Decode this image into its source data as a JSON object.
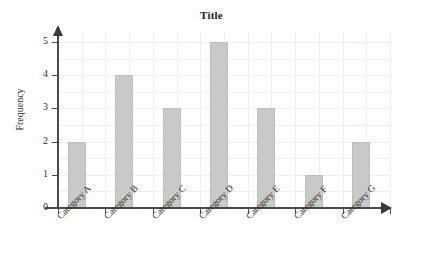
{
  "chart_data": {
    "type": "bar",
    "title": "Title",
    "xlabel": "",
    "ylabel": "Frequency",
    "categories": [
      "Category A",
      "Category B",
      "Category C",
      "Category D",
      "Category E",
      "Category F",
      "Category G"
    ],
    "values": [
      2,
      4,
      3,
      5,
      3,
      1,
      2
    ],
    "ylim": [
      0,
      5
    ],
    "ytick_labels": [
      "0",
      "1",
      "2",
      "3",
      "4",
      "5"
    ],
    "ytick_values": [
      0,
      1,
      2,
      3,
      4,
      5
    ],
    "grid": true,
    "legend": false,
    "legend_position": "none",
    "colors": {
      "bar_fill": "#c9c9c9",
      "bar_border": "#bdbdbd",
      "grid": "#f2eeee",
      "axis": "#4a4a4a",
      "text": "#2b2b2b",
      "title": "#1a1a1a",
      "background": "#ffffff"
    },
    "axis_style": {
      "y_arrow": "up-arrow",
      "x_arrow": "right-arrow",
      "xtick_label_rotation": -45
    }
  }
}
